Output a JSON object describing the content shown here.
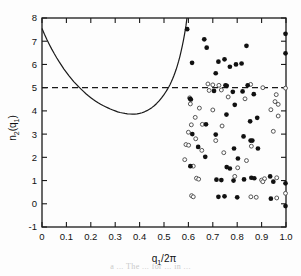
{
  "figure": {
    "background": "#fdfdfd",
    "frame_color": "#1a1a1a",
    "caption_faint": "a ... The ... for ... in ..."
  },
  "axes": {
    "x_label_main": "q",
    "x_label_sub": "1",
    "x_label_tail": "/2π",
    "y_label_main": "n",
    "y_label_sub": "2",
    "y_label_open": "(q",
    "y_label_sub2": "1",
    "y_label_close": ")",
    "x_ticks": [
      "0",
      "0.1",
      "0.2",
      "0.3",
      "0.4",
      "0.5",
      "0.6",
      "0.7",
      "0.8",
      "0.9",
      "1.0"
    ],
    "y_ticks": [
      "-1",
      "0",
      "1",
      "2",
      "3",
      "4",
      "5",
      "6",
      "7",
      "8"
    ]
  },
  "chart_data": {
    "type": "scatter",
    "title": "",
    "xlabel": "q1/2π",
    "ylabel": "n2(q1)",
    "xlim": [
      0.0,
      1.0
    ],
    "ylim": [
      -1.0,
      8.0
    ],
    "xticks": [
      0.0,
      0.1,
      0.2,
      0.3,
      0.4,
      0.5,
      0.6,
      0.7,
      0.8,
      0.9,
      1.0
    ],
    "yticks": [
      -1,
      0,
      1,
      2,
      3,
      4,
      5,
      6,
      7,
      8
    ],
    "grid": false,
    "legend": null,
    "annotations": [
      {
        "type": "hline",
        "y": 5.0,
        "style": "dashed",
        "label": "n2 = 5 reference level",
        "x_from": 0.0,
        "x_to": 1.0
      }
    ],
    "series": [
      {
        "name": "theoretical curve",
        "type": "line",
        "style": "solid",
        "color": "#1a1a1a",
        "points": [
          [
            0.0,
            7.55
          ],
          [
            0.01,
            7.3
          ],
          [
            0.02,
            7.07
          ],
          [
            0.03,
            6.86
          ],
          [
            0.04,
            6.66
          ],
          [
            0.05,
            6.47
          ],
          [
            0.06,
            6.29
          ],
          [
            0.07,
            6.12
          ],
          [
            0.08,
            5.96
          ],
          [
            0.09,
            5.8
          ],
          [
            0.1,
            5.66
          ],
          [
            0.11,
            5.52
          ],
          [
            0.12,
            5.39
          ],
          [
            0.13,
            5.26
          ],
          [
            0.14,
            5.15
          ],
          [
            0.15,
            5.04
          ],
          [
            0.155,
            4.99
          ],
          [
            0.16,
            4.94
          ],
          [
            0.17,
            4.84
          ],
          [
            0.18,
            4.74
          ],
          [
            0.19,
            4.65
          ],
          [
            0.2,
            4.57
          ],
          [
            0.21,
            4.49
          ],
          [
            0.22,
            4.42
          ],
          [
            0.23,
            4.35
          ],
          [
            0.24,
            4.29
          ],
          [
            0.25,
            4.23
          ],
          [
            0.26,
            4.18
          ],
          [
            0.27,
            4.13
          ],
          [
            0.28,
            4.08
          ],
          [
            0.29,
            4.04
          ],
          [
            0.3,
            4.0
          ],
          [
            0.31,
            3.96
          ],
          [
            0.32,
            3.93
          ],
          [
            0.33,
            3.91
          ],
          [
            0.34,
            3.89
          ],
          [
            0.35,
            3.875
          ],
          [
            0.36,
            3.865
          ],
          [
            0.37,
            3.86
          ],
          [
            0.38,
            3.86
          ],
          [
            0.39,
            3.87
          ],
          [
            0.4,
            3.89
          ],
          [
            0.41,
            3.92
          ],
          [
            0.42,
            3.96
          ],
          [
            0.43,
            4.01
          ],
          [
            0.44,
            4.07
          ],
          [
            0.45,
            4.14
          ],
          [
            0.46,
            4.22
          ],
          [
            0.47,
            4.32
          ],
          [
            0.48,
            4.43
          ],
          [
            0.49,
            4.56
          ],
          [
            0.5,
            4.7
          ],
          [
            0.505,
            4.78
          ],
          [
            0.51,
            4.86
          ],
          [
            0.515,
            4.95
          ],
          [
            0.52,
            5.04
          ],
          [
            0.525,
            5.14
          ],
          [
            0.53,
            5.25
          ],
          [
            0.535,
            5.37
          ],
          [
            0.54,
            5.5
          ],
          [
            0.545,
            5.64
          ],
          [
            0.55,
            5.79
          ],
          [
            0.555,
            5.96
          ],
          [
            0.56,
            6.14
          ],
          [
            0.565,
            6.34
          ],
          [
            0.57,
            6.56
          ],
          [
            0.575,
            6.8
          ],
          [
            0.58,
            7.06
          ],
          [
            0.585,
            7.35
          ],
          [
            0.59,
            7.67
          ],
          [
            0.594,
            8.0
          ]
        ]
      },
      {
        "name": "filled circles",
        "type": "scatter",
        "marker": "filled-circle",
        "color": "#111111",
        "points": [
          [
            0.595,
            7.52
          ],
          [
            0.665,
            7.08
          ],
          [
            0.675,
            6.72
          ],
          [
            0.838,
            6.8
          ],
          [
            0.998,
            7.32
          ],
          [
            0.998,
            6.48
          ],
          [
            0.615,
            6.07
          ],
          [
            0.723,
            6.12
          ],
          [
            0.748,
            6.22
          ],
          [
            0.795,
            6.0
          ],
          [
            0.818,
            6.04
          ],
          [
            0.77,
            5.9
          ],
          [
            0.712,
            5.62
          ],
          [
            0.752,
            5.1
          ],
          [
            0.757,
            5.08
          ],
          [
            0.843,
            5.1
          ],
          [
            0.705,
            4.86
          ],
          [
            0.782,
            4.82
          ],
          [
            0.822,
            4.84
          ],
          [
            0.868,
            4.72
          ],
          [
            0.607,
            4.52
          ],
          [
            0.61,
            4.49
          ],
          [
            0.79,
            4.26
          ],
          [
            0.756,
            3.84
          ],
          [
            0.672,
            3.42
          ],
          [
            0.853,
            3.55
          ],
          [
            0.882,
            3.7
          ],
          [
            0.616,
            3.0
          ],
          [
            0.712,
            2.98
          ],
          [
            0.826,
            2.9
          ],
          [
            0.855,
            2.72
          ],
          [
            0.862,
            2.72
          ],
          [
            0.64,
            2.45
          ],
          [
            0.787,
            2.38
          ],
          [
            0.669,
            2.02
          ],
          [
            0.803,
            1.95
          ],
          [
            0.608,
            1.62
          ],
          [
            0.757,
            1.58
          ],
          [
            0.77,
            1.52
          ],
          [
            0.715,
            1.04
          ],
          [
            0.735,
            1.02
          ],
          [
            0.785,
            1.0
          ],
          [
            0.828,
            1.05
          ],
          [
            0.858,
            1.12
          ],
          [
            0.87,
            1.1
          ],
          [
            0.935,
            1.18
          ],
          [
            0.948,
            0.95
          ],
          [
            0.998,
            0.88
          ],
          [
            0.723,
            0.3
          ],
          [
            0.748,
            0.32
          ],
          [
            0.8,
            0.28
          ],
          [
            0.938,
            0.22
          ],
          [
            0.998,
            -0.1
          ],
          [
            0.885,
            2.38
          ]
        ]
      },
      {
        "name": "open circles",
        "type": "scatter",
        "marker": "open-circle",
        "color": "#555555",
        "points": [
          [
            0.68,
            5.16
          ],
          [
            0.7,
            5.12
          ],
          [
            0.725,
            5.1
          ],
          [
            0.855,
            5.14
          ],
          [
            0.905,
            5.0
          ],
          [
            0.998,
            4.98
          ],
          [
            0.605,
            4.56
          ],
          [
            0.763,
            4.6
          ],
          [
            0.832,
            4.52
          ],
          [
            0.96,
            4.7
          ],
          [
            0.608,
            4.3
          ],
          [
            0.955,
            4.4
          ],
          [
            0.968,
            4.28
          ],
          [
            0.645,
            4.12
          ],
          [
            0.7,
            4.04
          ],
          [
            0.938,
            4.05
          ],
          [
            0.628,
            3.72
          ],
          [
            0.968,
            3.78
          ],
          [
            0.612,
            3.4
          ],
          [
            0.657,
            3.42
          ],
          [
            0.738,
            3.35
          ],
          [
            0.6,
            3.08
          ],
          [
            0.948,
            3.12
          ],
          [
            0.63,
            2.8
          ],
          [
            0.712,
            2.72
          ],
          [
            0.59,
            2.55
          ],
          [
            0.601,
            2.52
          ],
          [
            0.858,
            2.48
          ],
          [
            0.655,
            2.3
          ],
          [
            0.745,
            2.2
          ],
          [
            0.585,
            1.9
          ],
          [
            0.838,
            1.86
          ],
          [
            0.62,
            1.62
          ],
          [
            0.802,
            1.55
          ],
          [
            0.633,
            1.1
          ],
          [
            0.642,
            1.06
          ],
          [
            0.79,
            1.18
          ],
          [
            0.9,
            1.02
          ],
          [
            0.912,
            1.08
          ],
          [
            0.962,
            1.12
          ],
          [
            0.613,
            0.35
          ],
          [
            0.62,
            0.3
          ],
          [
            0.856,
            0.3
          ],
          [
            0.878,
            0.28
          ],
          [
            0.962,
            0.25
          ],
          [
            0.998,
            0.45
          ],
          [
            0.905,
            0.95
          ],
          [
            0.735,
            4.9
          ],
          [
            0.685,
            4.88
          ]
        ]
      }
    ]
  }
}
